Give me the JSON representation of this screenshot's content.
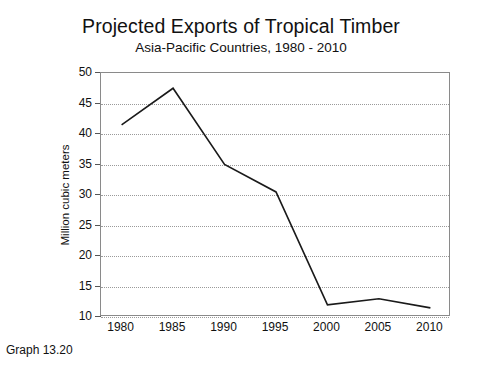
{
  "caption": "Graph 13.20",
  "chart_data": {
    "type": "line",
    "title": "Projected Exports of Tropical Timber",
    "subtitle": "Asia-Pacific Countries, 1980 - 2010",
    "xlabel": "",
    "ylabel": "Million cubic meters",
    "x": [
      1980,
      1985,
      1990,
      1995,
      2000,
      2005,
      2010
    ],
    "categories": [
      "1980",
      "1985",
      "1990",
      "1995",
      "2000",
      "2005",
      "2010"
    ],
    "values": [
      41.5,
      47.5,
      35,
      30.5,
      12,
      13,
      11.5
    ],
    "series": [
      {
        "name": "Projected exports",
        "values": [
          41.5,
          47.5,
          35,
          30.5,
          12,
          13,
          11.5
        ]
      }
    ],
    "ylim": [
      10,
      50
    ],
    "xlim": [
      1978,
      2012
    ],
    "yticks": [
      10,
      15,
      20,
      25,
      30,
      35,
      40,
      45,
      50
    ],
    "ytick_labels": [
      "10",
      "15",
      "20",
      "25",
      "30",
      "35",
      "40",
      "45",
      "50"
    ],
    "xticks": [
      1980,
      1985,
      1990,
      1995,
      2000,
      2005,
      2010
    ],
    "xtick_labels": [
      "1980",
      "1985",
      "1990",
      "1995",
      "2000",
      "2005",
      "2010"
    ],
    "grid": "horizontal-dotted",
    "legend": "none",
    "line_color": "#1a1a1a",
    "grid_color": "#9a9a9a",
    "frame_color": "#8a8a8a",
    "background": "#ffffff"
  }
}
